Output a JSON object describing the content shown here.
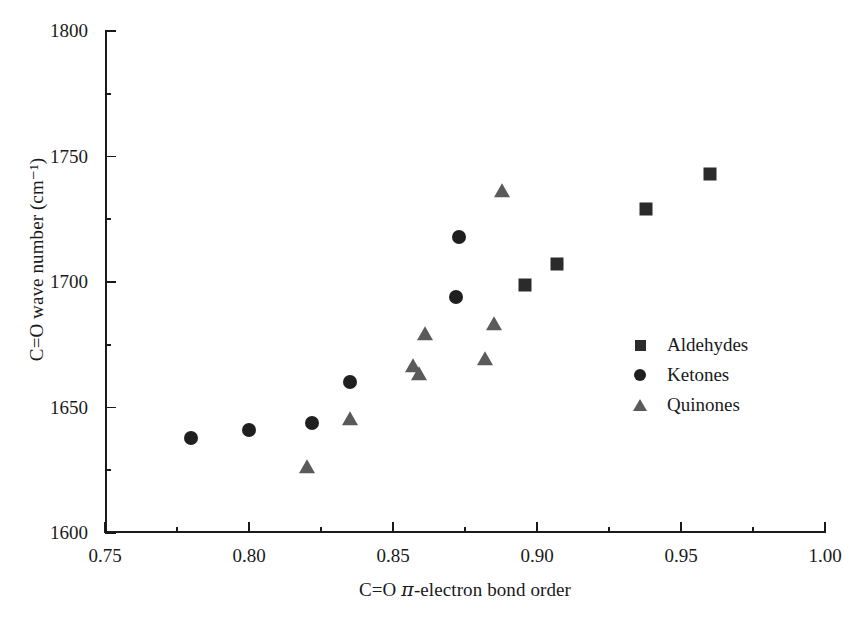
{
  "chart_data": {
    "type": "scatter",
    "title": "",
    "xlabel": "C=O π-electron bond order",
    "ylabel": "C=O wave number (cm⁻¹)",
    "xlim": [
      0.75,
      1.0
    ],
    "ylim": [
      1600,
      1800
    ],
    "xticks": [
      "0.75",
      "0.80",
      "0.85",
      "0.90",
      "0.95",
      "1.00"
    ],
    "xtick_values": [
      0.75,
      0.8,
      0.85,
      0.9,
      0.95,
      1.0
    ],
    "xminor_step": 0.025,
    "yticks": [
      "1600",
      "1650",
      "1700",
      "1750",
      "1800"
    ],
    "ytick_values": [
      1600,
      1650,
      1700,
      1750,
      1800
    ],
    "yminor_step": 25,
    "grid": false,
    "legend_position": "right-center",
    "series": [
      {
        "name": "Aldehydes",
        "marker": "square",
        "color": "#2b2b2b",
        "points": [
          {
            "x": 0.896,
            "y": 1699
          },
          {
            "x": 0.907,
            "y": 1707
          },
          {
            "x": 0.938,
            "y": 1729
          },
          {
            "x": 0.96,
            "y": 1743
          }
        ]
      },
      {
        "name": "Ketones",
        "marker": "circle",
        "color": "#1f1f1f",
        "points": [
          {
            "x": 0.78,
            "y": 1638
          },
          {
            "x": 0.8,
            "y": 1641
          },
          {
            "x": 0.822,
            "y": 1644
          },
          {
            "x": 0.835,
            "y": 1660
          },
          {
            "x": 0.872,
            "y": 1694
          },
          {
            "x": 0.873,
            "y": 1718
          }
        ]
      },
      {
        "name": "Quinones",
        "marker": "triangle",
        "color": "#5a5a5a",
        "points": [
          {
            "x": 0.82,
            "y": 1626
          },
          {
            "x": 0.835,
            "y": 1645
          },
          {
            "x": 0.857,
            "y": 1666
          },
          {
            "x": 0.859,
            "y": 1663
          },
          {
            "x": 0.861,
            "y": 1679
          },
          {
            "x": 0.882,
            "y": 1669
          },
          {
            "x": 0.885,
            "y": 1683
          },
          {
            "x": 0.888,
            "y": 1736
          }
        ]
      }
    ]
  },
  "legend": {
    "items": [
      {
        "label": "Aldehydes"
      },
      {
        "label": "Ketones"
      },
      {
        "label": "Quinones"
      }
    ]
  },
  "axis_labels": {
    "x_prefix": "C=O ",
    "x_pi": "π",
    "x_suffix": "-electron bond order",
    "y": "C=O wave number (cm⁻¹)"
  }
}
